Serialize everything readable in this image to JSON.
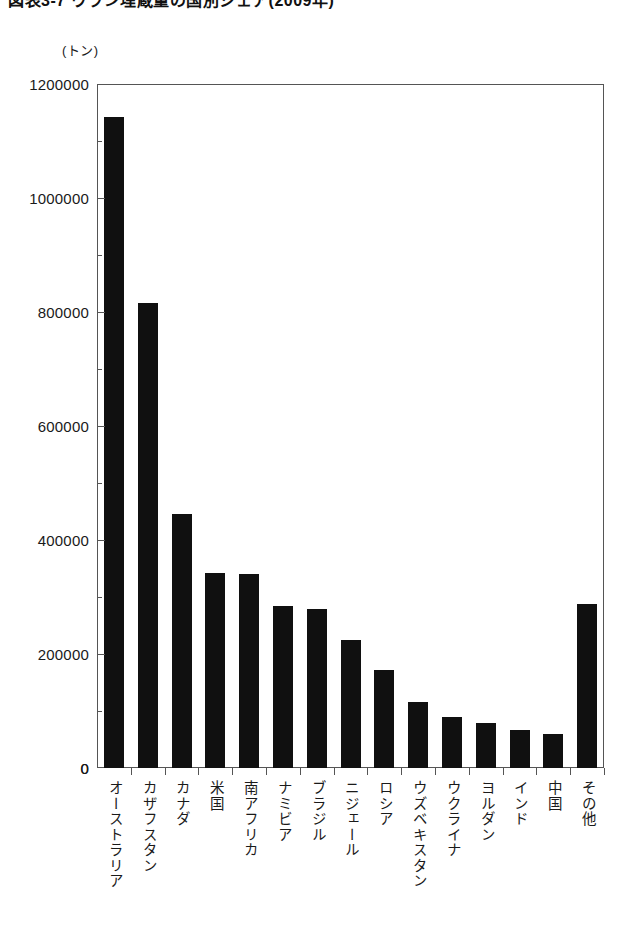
{
  "title": {
    "text": "図表3-7 ウラン埋蔵量の国別シェア(2009年)",
    "truncated": true
  },
  "unit_label": "(トン)",
  "zero_label": "0",
  "chart_data": {
    "type": "bar",
    "title": "図表3-7 ウラン埋蔵量の国別シェア(2009年)",
    "xlabel": "",
    "ylabel": "(トン)",
    "ylim": [
      0,
      1200000
    ],
    "grid": false,
    "legend": "none",
    "yticks": [
      0,
      200000,
      400000,
      600000,
      800000,
      1000000,
      1200000
    ],
    "ytick_labels": [
      "0",
      "200000",
      "400000",
      "600000",
      "800000",
      "1000000",
      "1200000"
    ],
    "categories": [
      "オーストラリア",
      "カザフスタン",
      "カナダ",
      "米国",
      "南アフリカ",
      "ナミビア",
      "ブラジル",
      "ニジェール",
      "ロシア",
      "ウズベキスタン",
      "ウクライナ",
      "ヨルダン",
      "インド",
      "中国",
      "その他"
    ],
    "values": [
      1143000,
      816000,
      445000,
      342000,
      341000,
      284000,
      279000,
      225000,
      172000,
      116000,
      90000,
      79000,
      67000,
      60000,
      287000
    ],
    "bar_color": "#101010"
  }
}
